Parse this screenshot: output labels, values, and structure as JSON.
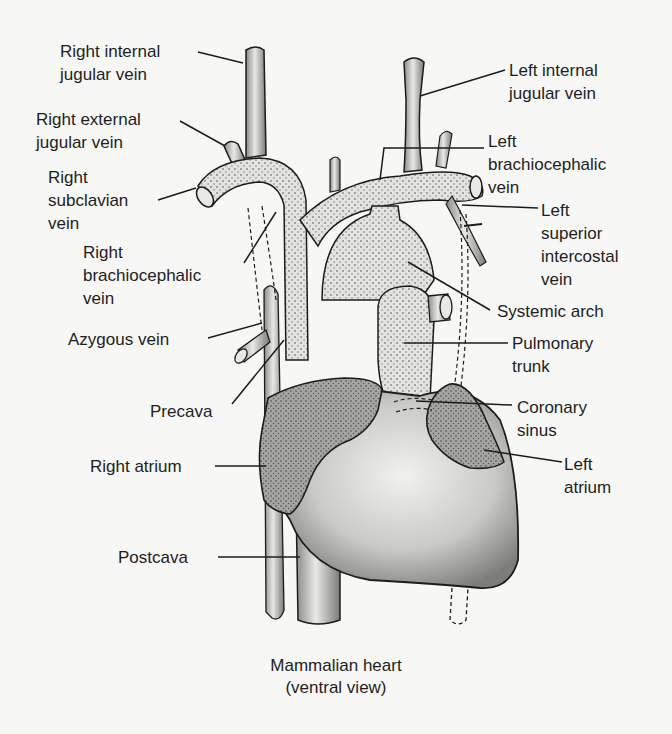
{
  "figure": {
    "title": "Mammalian heart",
    "subtitle": "(ventral view)"
  },
  "labels": {
    "right_internal_jugular": [
      "Right internal",
      "jugular vein"
    ],
    "right_external_jugular": [
      "Right external",
      "jugular vein"
    ],
    "right_subclavian": [
      "Right",
      "subclavian",
      "vein"
    ],
    "right_brachiocephalic": [
      "Right",
      "brachiocephalic",
      "vein"
    ],
    "azygous": [
      "Azygous vein"
    ],
    "precava": [
      "Precava"
    ],
    "right_atrium": [
      "Right atrium"
    ],
    "postcava": [
      "Postcava"
    ],
    "left_internal_jugular": [
      "Left internal",
      "jugular vein"
    ],
    "left_brachiocephalic": [
      "Left",
      "brachiocephalic",
      "vein"
    ],
    "left_superior_intercostal": [
      "Left",
      "superior",
      "intercostal",
      "vein"
    ],
    "systemic_arch": [
      "Systemic arch"
    ],
    "pulmonary_trunk": [
      "Pulmonary",
      "trunk"
    ],
    "coronary_sinus": [
      "Coronary",
      "sinus"
    ],
    "left_atrium": [
      "Left",
      "atrium"
    ]
  },
  "colors": {
    "background": "#f7f7f5",
    "ink": "#1c1c1c",
    "vessel_fill": "#d9d9d6",
    "heart_fill": "#cfcfcc",
    "atrium_fill": "#9a9a98"
  }
}
